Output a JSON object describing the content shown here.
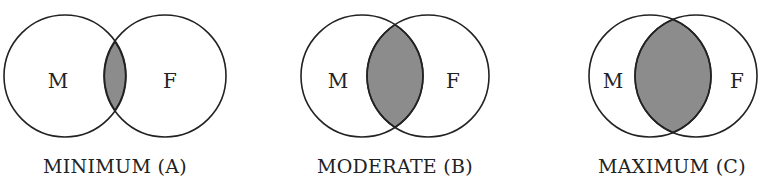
{
  "figure": {
    "fill_color": "#8c8c8c",
    "stroke_color": "#222222",
    "diagrams": [
      {
        "id": "A",
        "caption": "MINIMUM (A)",
        "left_label": "M",
        "right_label": "F",
        "overlap": "minimum"
      },
      {
        "id": "B",
        "caption": "MODERATE (B)",
        "left_label": "M",
        "right_label": "F",
        "overlap": "moderate"
      },
      {
        "id": "C",
        "caption": "MAXIMUM (C)",
        "left_label": "M",
        "right_label": "F",
        "overlap": "maximum"
      }
    ]
  }
}
